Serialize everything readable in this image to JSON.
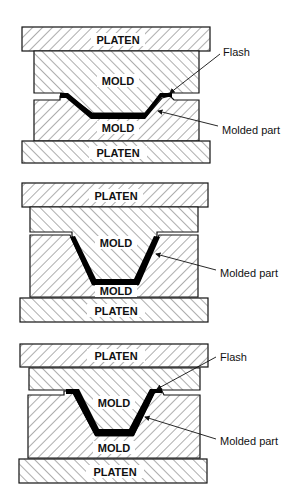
{
  "figure": {
    "diagrams": [
      {
        "id": "diagram-1",
        "top_platen": "PLATEN",
        "upper_mold": "MOLD",
        "lower_mold": "MOLD",
        "bottom_platen": "PLATEN",
        "callouts": [
          "Flash",
          "Molded part"
        ]
      },
      {
        "id": "diagram-2",
        "top_platen": "PLATEN",
        "upper_mold": "MOLD",
        "lower_mold": "MOLD",
        "bottom_platen": "PLATEN",
        "callouts": [
          "Molded part"
        ]
      },
      {
        "id": "diagram-3",
        "top_platen": "PLATEN",
        "upper_mold": "MOLD",
        "lower_mold": "MOLD",
        "bottom_platen": "PLATEN",
        "callouts": [
          "Flash",
          "Molded part"
        ]
      }
    ],
    "colors": {
      "outline": "#111111",
      "part": "#000000",
      "background": "#ffffff"
    }
  }
}
